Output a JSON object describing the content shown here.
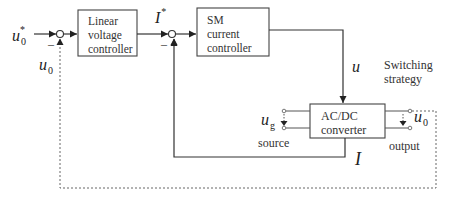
{
  "diagram": {
    "type": "control-block-diagram",
    "blocks": {
      "voltage_controller": {
        "line1": "Linear",
        "line2": "voltage",
        "line3": "controller"
      },
      "current_controller": {
        "line1": "SM",
        "line2": "current",
        "line3": "controller"
      },
      "converter": {
        "line1": "AC/DC",
        "line2": "converter"
      }
    },
    "signals": {
      "reference_voltage": {
        "base": "u",
        "sub": "0",
        "sup": "*"
      },
      "feedback_voltage": {
        "base": "u",
        "sub": "0"
      },
      "reference_current": {
        "base": "I",
        "sup": "*"
      },
      "control_signal": {
        "base": "u"
      },
      "source_voltage": {
        "base": "u",
        "sub": "g"
      },
      "output_voltage": {
        "base": "u",
        "sub": "0"
      },
      "feedback_current": {
        "base": "I"
      }
    },
    "summing_junctions": {
      "sum1_minus": "–",
      "sum2_minus": "–"
    },
    "labels": {
      "switching_line1": "Switching",
      "switching_line2": "strategy",
      "source": "source",
      "output": "output"
    }
  }
}
